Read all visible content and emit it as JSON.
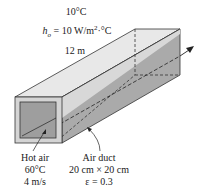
{
  "ambient": {
    "temperature": "10°C",
    "h_symbol": "h",
    "h_subscript": "o",
    "h_value": " = 10 W/m",
    "h_exp": "2",
    "h_unit": "·°C",
    "length": "12 m"
  },
  "inlet": {
    "line1": "Hot air",
    "line2": "60°C",
    "line3": "4 m/s"
  },
  "duct": {
    "line1": "Air duct",
    "line2": "20 cm × 20 cm",
    "line3": "ε = 0.3"
  },
  "colors": {
    "top_face": "#e6e6e6",
    "side_face": "#a9a9a9",
    "front_rim": "#d2d2d2",
    "inner": "#9c9c9c",
    "edge": "#333333"
  }
}
